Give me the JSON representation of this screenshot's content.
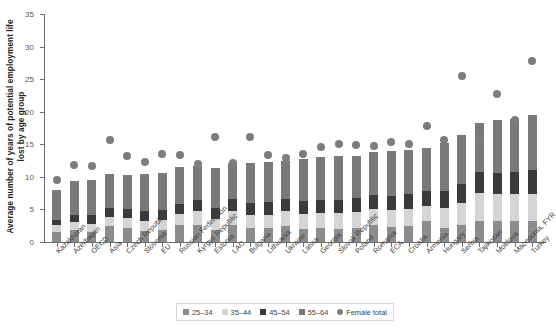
{
  "chart_data": {
    "type": "bar",
    "stacked": true,
    "title": "",
    "xlabel": "",
    "ylabel": "Average number of years of potential employment life lost by age group",
    "ylim": [
      0,
      35
    ],
    "yticks": [
      0,
      5,
      10,
      15,
      20,
      25,
      30,
      35
    ],
    "grid": false,
    "legend_position": "bottom",
    "categories": [
      "Kazakhstan",
      "Azerbaijan",
      "OECD",
      "Asia",
      "Czech Republic",
      "Slovenia",
      "EU",
      "Russian Federation",
      "Kyrgyz Republic",
      "Estonia",
      "LAC",
      "Bulgaria",
      "Lithuania",
      "Ukraine",
      "Latvia",
      "Georgia",
      "Slovak Republic",
      "Poland",
      "Romania",
      "ECA",
      "Croatia",
      "Armenia",
      "Hungary",
      "Serbia",
      "Tajikistan",
      "Moldova",
      "Macedonia, FYR",
      "Turkey"
    ],
    "series": [
      {
        "name": "25–34",
        "color": "#8a8c8e",
        "values": [
          1.6,
          1.9,
          1.6,
          2.4,
          2.2,
          1.7,
          1.8,
          2.6,
          2.6,
          1.9,
          2.6,
          2.1,
          2.1,
          2.4,
          2.0,
          2.1,
          2.0,
          2.1,
          2.6,
          2.3,
          2.4,
          3.2,
          2.2,
          2.6,
          3.3,
          3.2,
          3.3,
          3.2
        ]
      },
      {
        "name": "35–44",
        "color": "#d4d5d6",
        "values": [
          1.0,
          1.2,
          1.2,
          1.4,
          1.5,
          1.6,
          1.6,
          1.7,
          2.1,
          1.7,
          2.2,
          2.0,
          2.1,
          2.3,
          2.3,
          2.4,
          2.4,
          2.5,
          2.4,
          2.6,
          2.6,
          2.4,
          3.0,
          3.4,
          4.3,
          4.1,
          4.1,
          4.2
        ]
      },
      {
        "name": "45–54",
        "color": "#3a3a3c",
        "values": [
          0.8,
          1.1,
          1.3,
          1.4,
          1.4,
          1.5,
          1.5,
          1.6,
          1.7,
          1.7,
          1.8,
          1.9,
          1.9,
          1.9,
          2.0,
          2.0,
          2.0,
          2.1,
          2.2,
          2.2,
          2.3,
          2.3,
          2.6,
          2.9,
          3.2,
          3.3,
          3.4,
          3.6
        ]
      },
      {
        "name": "55–64",
        "color": "#77797b",
        "values": [
          4.6,
          5.1,
          5.4,
          5.3,
          5.2,
          5.6,
          5.7,
          5.6,
          5.2,
          6.0,
          5.5,
          6.2,
          6.2,
          5.9,
          6.4,
          6.6,
          6.8,
          6.5,
          6.6,
          6.8,
          6.9,
          6.6,
          7.4,
          7.6,
          7.4,
          8.2,
          8.1,
          8.5
        ]
      }
    ],
    "overlay_series": {
      "name": "Female total",
      "type": "scatter",
      "color": "#7b7d7f",
      "values": [
        10.2,
        12.5,
        12.3,
        16.2,
        13.8,
        12.9,
        14.1,
        14.0,
        12.6,
        16.7,
        12.7,
        16.8,
        14.0,
        13.5,
        14.1,
        15.2,
        15.6,
        15.5,
        15.4,
        15.9,
        15.7,
        18.4,
        16.3,
        26.1,
        16.0,
        23.3,
        19.3,
        28.4
      ]
    }
  },
  "legend": {
    "items": [
      {
        "label": "25–34",
        "marker": "square",
        "color": "#8a8c8e"
      },
      {
        "label": "35–44",
        "marker": "square",
        "color": "#d4d5d6"
      },
      {
        "label": "45–54",
        "marker": "square",
        "color": "#3a3a3c"
      },
      {
        "label": "55–64",
        "marker": "square",
        "color": "#77797b"
      },
      {
        "label": "Female total",
        "marker": "circle",
        "color": "#7b7d7f"
      }
    ]
  }
}
